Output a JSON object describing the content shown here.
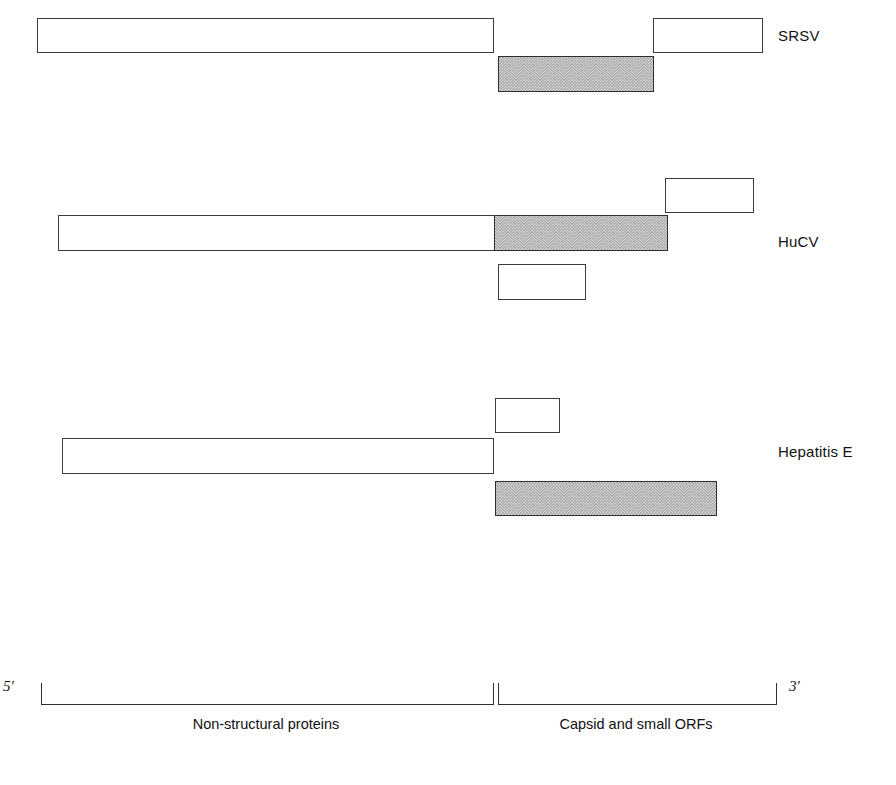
{
  "figure": {
    "type": "genome-organization-diagram",
    "background_color": "#ffffff",
    "stroke_color": "#3b3b3b",
    "shaded_fill_color": "#a9a9a9",
    "open_fill_color": "#ffffff"
  },
  "genomes": [
    {
      "id": "srsv",
      "label": "SRSV",
      "label_x": 778,
      "label_y": 27,
      "orfs": [
        {
          "name": "orf1",
          "shaded": false,
          "x": 37,
          "y": 18,
          "w": 457,
          "h": 35
        },
        {
          "name": "orf2",
          "shaded": true,
          "x": 498,
          "y": 56,
          "w": 156,
          "h": 36
        },
        {
          "name": "orf3",
          "shaded": false,
          "x": 653,
          "y": 18,
          "w": 110,
          "h": 35
        }
      ]
    },
    {
      "id": "hucv",
      "label": "HuCV",
      "label_x": 778,
      "label_y": 233,
      "orfs": [
        {
          "name": "orf1-nonstructural",
          "shaded": false,
          "x": 58,
          "y": 215,
          "w": 437,
          "h": 36
        },
        {
          "name": "orf1-capsid",
          "shaded": true,
          "x": 494,
          "y": 215,
          "w": 174,
          "h": 36
        },
        {
          "name": "orf2",
          "shaded": false,
          "x": 665,
          "y": 178,
          "w": 89,
          "h": 35
        },
        {
          "name": "orf3",
          "shaded": false,
          "x": 498,
          "y": 264,
          "w": 88,
          "h": 36
        }
      ]
    },
    {
      "id": "hepatitis-e",
      "label": "Hepatitis E",
      "label_x": 778,
      "label_y": 443,
      "orfs": [
        {
          "name": "orf1",
          "shaded": false,
          "x": 62,
          "y": 438,
          "w": 432,
          "h": 36
        },
        {
          "name": "orf3",
          "shaded": false,
          "x": 495,
          "y": 398,
          "w": 65,
          "h": 35
        },
        {
          "name": "orf2",
          "shaded": true,
          "x": 495,
          "y": 481,
          "w": 222,
          "h": 35
        }
      ]
    }
  ],
  "scale": {
    "five_prime_label": "5′",
    "three_prime_label": "3′",
    "five_prime_x": 3,
    "three_prime_x": 789,
    "label_y": 678,
    "brackets": [
      {
        "id": "non-structural",
        "x": 41,
        "y": 683,
        "w": 453,
        "h": 22
      },
      {
        "id": "capsid",
        "x": 498,
        "y": 683,
        "w": 279,
        "h": 22
      }
    ],
    "regions": [
      {
        "id": "non-structural",
        "text": "Non-structural proteins",
        "center_x": 266,
        "y": 716
      },
      {
        "id": "capsid",
        "text": "Capsid and small ORFs",
        "center_x": 636,
        "y": 716
      }
    ]
  }
}
